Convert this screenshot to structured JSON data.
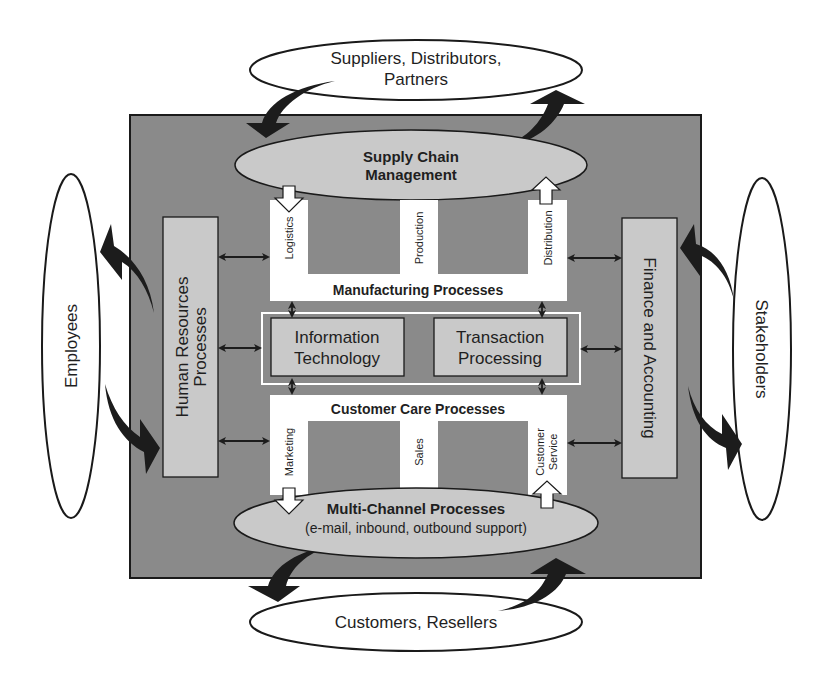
{
  "colors": {
    "background": "#ffffff",
    "main_box": "#8a8a8a",
    "light_shape": "#c9c9c9",
    "white_shape": "#ffffff",
    "stroke": "#1a1a1a",
    "arrow": "#1c1c1c"
  },
  "external": {
    "top": {
      "line1": "Suppliers, Distributors,",
      "line2": "Partners"
    },
    "bottom": {
      "label": "Customers, Resellers"
    },
    "left": {
      "label": "Employees"
    },
    "right": {
      "label": "Stakeholders"
    }
  },
  "core": {
    "supply_chain": {
      "line1": "Supply Chain",
      "line2": "Management"
    },
    "manufacturing": {
      "title": "Manufacturing Processes",
      "columns": [
        "Logistics",
        "Production",
        "Distribution"
      ]
    },
    "center": {
      "left": {
        "line1": "Information",
        "line2": "Technology"
      },
      "right": {
        "line1": "Transaction",
        "line2": "Processing"
      }
    },
    "customer_care": {
      "title": "Customer Care Processes",
      "columns": [
        "Marketing",
        "Sales",
        "Customer",
        "Service"
      ]
    },
    "multi_channel": {
      "line1": "Multi-Channel Processes",
      "line2": "(e-mail, inbound, outbound support)"
    },
    "hr": {
      "line1": "Human Resources",
      "line2": "Processes"
    },
    "finance": {
      "label": "Finance and Accounting"
    }
  }
}
